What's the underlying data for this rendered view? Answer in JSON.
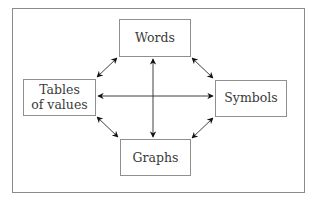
{
  "diagram": {
    "nodes": [
      {
        "id": "words",
        "label_lines": [
          "Words"
        ]
      },
      {
        "id": "tables",
        "label_lines": [
          "Tables",
          "of values"
        ]
      },
      {
        "id": "symbols",
        "label_lines": [
          "Symbols"
        ]
      },
      {
        "id": "graphs",
        "label_lines": [
          "Graphs"
        ]
      }
    ],
    "edges": [
      {
        "from": "words",
        "to": "tables",
        "direction": "both"
      },
      {
        "from": "words",
        "to": "symbols",
        "direction": "both"
      },
      {
        "from": "tables",
        "to": "graphs",
        "direction": "both"
      },
      {
        "from": "symbols",
        "to": "graphs",
        "direction": "both"
      },
      {
        "from": "words",
        "to": "graphs",
        "direction": "both"
      },
      {
        "from": "tables",
        "to": "symbols",
        "direction": "both"
      }
    ]
  }
}
